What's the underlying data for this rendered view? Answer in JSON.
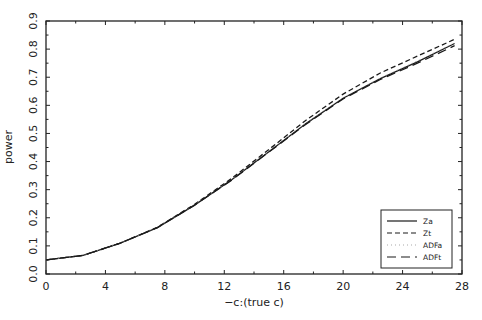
{
  "chart_data": {
    "type": "line",
    "title": "",
    "xlabel": "−c:(true c)",
    "ylabel": "power",
    "xlim": [
      0,
      28
    ],
    "ylim": [
      0,
      0.9
    ],
    "xticks": [
      0,
      4,
      8,
      12,
      16,
      20,
      24,
      28
    ],
    "xtick_labels": [
      "0",
      "4",
      "8",
      "12",
      "16",
      "20",
      "24",
      "28"
    ],
    "yticks": [
      0.0,
      0.1,
      0.2,
      0.3,
      0.4,
      0.5,
      0.6,
      0.7,
      0.8,
      0.9
    ],
    "ytick_labels": [
      "0.0",
      "0.1",
      "0.2",
      "0.3",
      "0.4",
      "0.5",
      "0.6",
      "0.7",
      "0.8",
      "0.9"
    ],
    "grid": false,
    "legend_position": "lower right",
    "x": [
      0,
      2.5,
      5,
      7.5,
      10,
      12.5,
      15,
      17.5,
      20,
      22.5,
      25,
      27.5
    ],
    "series": [
      {
        "name": "Za",
        "style": "solid",
        "values": [
          0.05,
          0.066,
          0.11,
          0.165,
          0.245,
          0.335,
          0.435,
          0.535,
          0.625,
          0.695,
          0.755,
          0.82
        ]
      },
      {
        "name": "Zt",
        "style": "dashed",
        "values": [
          0.05,
          0.066,
          0.11,
          0.166,
          0.248,
          0.34,
          0.443,
          0.547,
          0.64,
          0.715,
          0.775,
          0.835
        ]
      },
      {
        "name": "ADFa",
        "style": "dotted",
        "values": [
          0.05,
          0.066,
          0.11,
          0.165,
          0.246,
          0.336,
          0.436,
          0.536,
          0.627,
          0.697,
          0.758,
          0.822
        ]
      },
      {
        "name": "ADFt",
        "style": "long-dash",
        "values": [
          0.05,
          0.066,
          0.11,
          0.165,
          0.245,
          0.334,
          0.434,
          0.533,
          0.623,
          0.692,
          0.75,
          0.812
        ]
      }
    ]
  }
}
